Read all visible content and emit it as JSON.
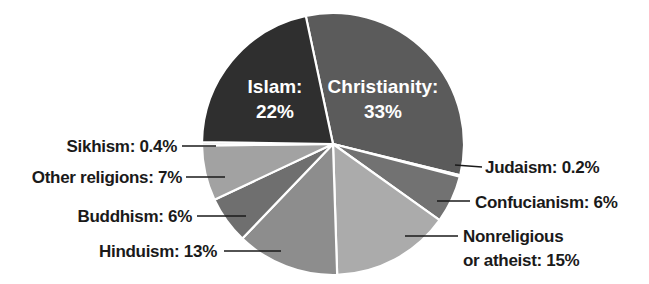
{
  "chart_data": {
    "type": "pie",
    "title": "",
    "start_angle_deg": -12,
    "direction": "clockwise",
    "center": [
      333,
      144
    ],
    "radius": 131,
    "slices": [
      {
        "name": "Christianity",
        "value": 33,
        "label": "Christianity:",
        "pct": "33%",
        "color": "#5b5b5b",
        "label_pos": "inside"
      },
      {
        "name": "Judaism",
        "value": 0.2,
        "label": "Judaism: 0.2%",
        "color": "#1c1c1c",
        "label_pos": "right"
      },
      {
        "name": "Confucianism",
        "value": 6,
        "label": "Confucianism: 6%",
        "color": "#727272",
        "label_pos": "right"
      },
      {
        "name": "Nonreligious or atheist",
        "value": 15,
        "label": "Nonreligious",
        "label2": "or atheist: 15%",
        "color": "#ababab",
        "label_pos": "right"
      },
      {
        "name": "Hinduism",
        "value": 13,
        "label": "Hinduism: 13%",
        "color": "#8d8d8d",
        "label_pos": "left"
      },
      {
        "name": "Buddhism",
        "value": 6,
        "label": "Buddhism: 6%",
        "color": "#6f6f6f",
        "label_pos": "left"
      },
      {
        "name": "Other religions",
        "value": 7,
        "label": "Other religions: 7%",
        "color": "#a2a2a2",
        "label_pos": "left"
      },
      {
        "name": "Sikhism",
        "value": 0.4,
        "label": "Sikhism: 0.4%",
        "color": "#cfcfcf",
        "label_pos": "left"
      },
      {
        "name": "Islam",
        "value": 22,
        "label": "Islam:",
        "pct": "22%",
        "color": "#2f2f2f",
        "label_pos": "inside"
      }
    ],
    "separator_color": "#ffffff"
  },
  "labels": {
    "christianity": "Christianity:",
    "christianity_pct": "33%",
    "islam": "Islam:",
    "islam_pct": "22%",
    "judaism": "Judaism: 0.2%",
    "confucianism": "Confucianism: 6%",
    "nonreligious_1": "Nonreligious",
    "nonreligious_2": "or atheist: 15%",
    "hinduism": "Hinduism: 13%",
    "buddhism": "Buddhism: 6%",
    "other": "Other religions: 7%",
    "sikhism": "Sikhism: 0.4%"
  }
}
